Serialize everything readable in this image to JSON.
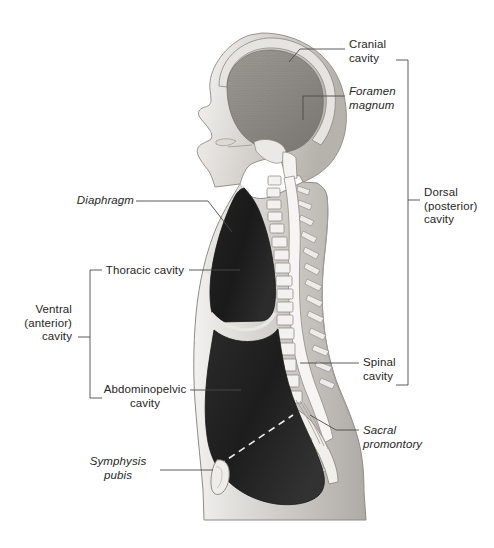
{
  "figure": {
    "background_color": "#ffffff",
    "text_color": "#262626",
    "line_color": "#4a4a4a"
  },
  "labels": [
    {
      "id": "cranial-cavity",
      "text": "Cranial\ncavity",
      "style": "normal",
      "align": "left",
      "x": 349,
      "y": 38
    },
    {
      "id": "foramen-magnum",
      "text": "Foramen\nmagnum",
      "style": "italic",
      "align": "left",
      "x": 349,
      "y": 85
    },
    {
      "id": "dorsal-posterior-cavity",
      "text": "Dorsal\n(posterior)\ncavity",
      "style": "normal",
      "align": "left",
      "x": 424,
      "y": 186
    },
    {
      "id": "spinal-cavity",
      "text": "Spinal\ncavity",
      "style": "normal",
      "align": "left",
      "x": 363,
      "y": 356
    },
    {
      "id": "sacral-promontory",
      "text": "Sacral\npromontory",
      "style": "italic",
      "align": "left",
      "x": 363,
      "y": 424
    },
    {
      "id": "diaphragm",
      "text": "Diaphragm",
      "style": "italic",
      "align": "right",
      "x": 68,
      "y": 198
    },
    {
      "id": "thoracic-cavity",
      "text": "Thoracic cavity",
      "style": "normal",
      "align": "right",
      "x": 24,
      "y": 264
    },
    {
      "id": "ventral-anterior-cavity",
      "text": "Ventral\n(anterior)\ncavity",
      "style": "normal",
      "align": "right",
      "x": 8,
      "y": 317
    },
    {
      "id": "abdominopelvic-cavity",
      "text": "Abdominopelvic\ncavity",
      "style": "normal",
      "align": "left",
      "x": 101,
      "y": 385
    },
    {
      "id": "symphysis-pubis",
      "text": "Symphysis\npubis",
      "style": "italic",
      "align": "right",
      "x": 88,
      "y": 463
    }
  ],
  "brackets": [
    {
      "id": "dorsal-bracket",
      "label": "Dorsal (posterior) cavity",
      "side": "right",
      "x": 408,
      "top": 60,
      "bottom": 385,
      "tick_y": 200
    },
    {
      "id": "ventral-bracket",
      "label": "Ventral (anterior) cavity",
      "side": "left",
      "x": 90,
      "top": 270,
      "bottom": 398,
      "tick_y": 337
    }
  ],
  "anatomy_parts": [
    {
      "id": "skull-cranial-cavity",
      "name": "Cranial cavity (brain)"
    },
    {
      "id": "face-profile",
      "name": "Facial profile"
    },
    {
      "id": "vertebral-column",
      "name": "Vertebral column"
    },
    {
      "id": "spinal-canal",
      "name": "Spinal canal"
    },
    {
      "id": "thoracic-cavity-region",
      "name": "Thoracic cavity"
    },
    {
      "id": "diaphragm-line",
      "name": "Diaphragm"
    },
    {
      "id": "abdominopelvic-cavity-region",
      "name": "Abdominopelvic cavity"
    },
    {
      "id": "pelvic-brim-dashed",
      "name": "Pelvic brim (dashed)"
    },
    {
      "id": "symphysis-pubis-bone",
      "name": "Symphysis pubis"
    },
    {
      "id": "sacrum-coccyx",
      "name": "Sacrum and coccyx"
    }
  ]
}
